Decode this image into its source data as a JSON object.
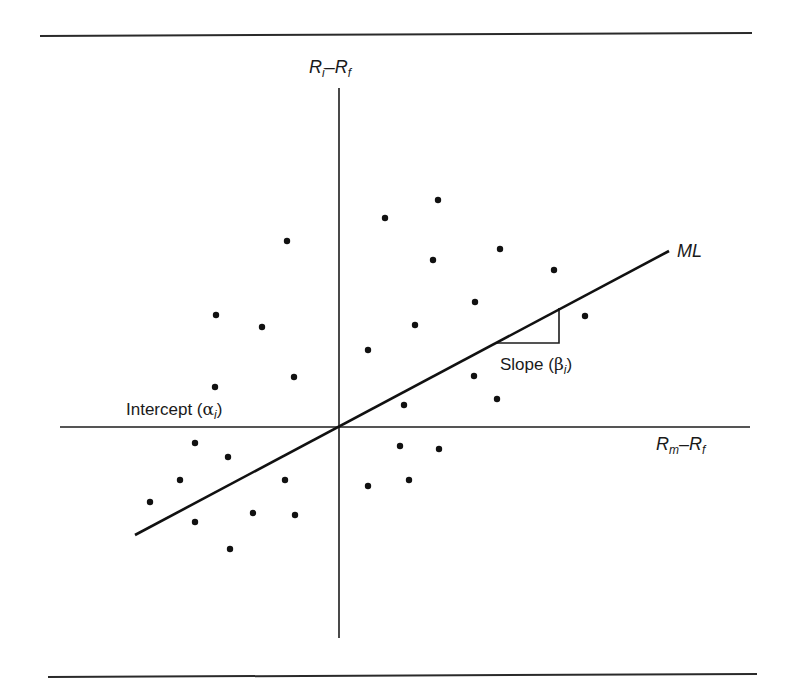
{
  "figure": {
    "rules": {
      "top": {
        "x1": 40,
        "y1": 36,
        "x2": 752,
        "y2": 33
      },
      "bottom": {
        "x1": 48,
        "y1": 677,
        "x2": 757,
        "y2": 674
      }
    },
    "axes": {
      "origin": {
        "x": 339,
        "y": 427
      },
      "vertical": {
        "x": 339,
        "y1": 88,
        "y2": 638
      },
      "horizontal": {
        "y": 427,
        "x1": 60,
        "x2": 750
      }
    },
    "y_axis_label": {
      "var": "R",
      "sub": "i",
      "op": "–",
      "var2": "R",
      "sub2": "f"
    },
    "x_axis_label": {
      "var": "R",
      "sub": "m",
      "op": "–",
      "var2": "R",
      "sub2": "f"
    },
    "line_label": "ML",
    "slope_label": {
      "text": "Slope (",
      "greek": "β",
      "sub": "i",
      "close": ")"
    },
    "intercept_label": {
      "text": "Intercept (",
      "greek": "α",
      "sub": "i",
      "close": ")"
    },
    "fit_line": {
      "x1": 135,
      "y1": 535,
      "x2": 669,
      "y2": 251
    },
    "slope_triangle": {
      "x1": 495,
      "y1": 343,
      "x2": 559,
      "y2": 343,
      "x3": 559,
      "y3": 308
    },
    "colors": {
      "ink": "#111111",
      "background": "#ffffff"
    }
  },
  "chart_data": {
    "type": "scatter",
    "title": "",
    "xlabel": "Rm − Rf",
    "ylabel": "Ri − Rf",
    "legend": [],
    "grid": false,
    "annotations": [
      "ML",
      "Slope (βi)",
      "Intercept (αi)"
    ],
    "fit_line": {
      "name": "ML",
      "slope_pixel_ratio": 0.53,
      "intercept": 0
    },
    "points_pixel": [
      [
        438,
        200
      ],
      [
        385,
        218
      ],
      [
        287,
        241
      ],
      [
        500,
        249
      ],
      [
        433,
        260
      ],
      [
        554,
        270
      ],
      [
        475,
        302
      ],
      [
        216,
        315
      ],
      [
        585,
        316
      ],
      [
        415,
        325
      ],
      [
        262,
        327
      ],
      [
        368,
        350
      ],
      [
        474,
        376
      ],
      [
        294,
        377
      ],
      [
        215,
        387
      ],
      [
        497,
        399
      ],
      [
        404,
        405
      ],
      [
        195,
        443
      ],
      [
        400,
        446
      ],
      [
        439,
        449
      ],
      [
        228,
        457
      ],
      [
        180,
        480
      ],
      [
        285,
        480
      ],
      [
        409,
        480
      ],
      [
        368,
        486
      ],
      [
        150,
        502
      ],
      [
        253,
        513
      ],
      [
        295,
        515
      ],
      [
        195,
        522
      ],
      [
        230,
        549
      ]
    ]
  }
}
